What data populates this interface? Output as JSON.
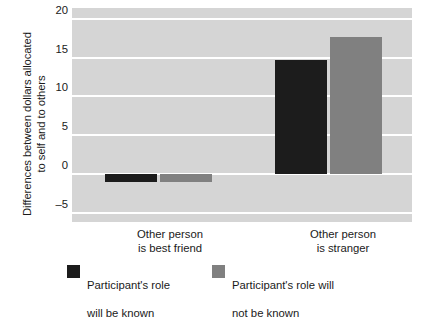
{
  "chart_data": {
    "type": "bar",
    "title": "",
    "xlabel": "",
    "ylabel_line1": "Differences between dollars allocated",
    "ylabel_line2": "to self and to others",
    "categories": [
      "Other person is best friend",
      "Other person is stranger"
    ],
    "category_labels": [
      {
        "line1": "Other person",
        "line2": "is best friend"
      },
      {
        "line1": "Other person",
        "line2": "is stranger"
      }
    ],
    "series": [
      {
        "name": "Participant's role will be known",
        "legend_line1": "Participant's role",
        "legend_line2": "will be known",
        "color": "#1c1c1c",
        "values": [
          -1.1,
          14.7
        ]
      },
      {
        "name": "Participant's role will not be known",
        "legend_line1": "Participant's role will",
        "legend_line2": "not be known",
        "color": "#808080",
        "values": [
          -1.0,
          17.7
        ]
      }
    ],
    "ylim": [
      -6.2,
      21.4
    ],
    "yticks": [
      20,
      15,
      10,
      5,
      0,
      -5
    ],
    "ytick_labels": [
      "20",
      "15",
      "10",
      "5",
      "0",
      "–5"
    ],
    "grid": true,
    "grid_color": "#ffffff",
    "plot_background": "#d5d5d5",
    "legend_position": "bottom"
  }
}
